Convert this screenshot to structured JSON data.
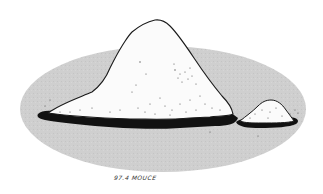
{
  "illustration": {
    "subject": "two piles of white granules on a gray oval",
    "caption": "97.4 MOUCE",
    "colors": {
      "background": "#ffffff",
      "oval": "#cfcfcf",
      "pile": "#fbfbfb",
      "outline": "#1a1a1a",
      "shadow": "#111111",
      "speckle": "#555555"
    }
  }
}
